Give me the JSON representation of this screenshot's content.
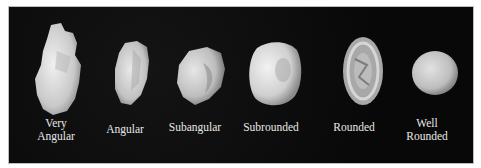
{
  "figure": {
    "background_color": "#0b0b0b",
    "label_color": "#e8e8e8",
    "classes": [
      {
        "label": "Very\nAngular",
        "x": 55,
        "shape": "very-angular"
      },
      {
        "label": "Angular",
        "x": 124,
        "shape": "angular"
      },
      {
        "label": "Subangular",
        "x": 194,
        "shape": "subangular"
      },
      {
        "label": "Subrounded",
        "x": 270,
        "shape": "subrounded"
      },
      {
        "label": "Rounded",
        "x": 353,
        "shape": "rounded"
      },
      {
        "label": "Well\nRounded",
        "x": 426,
        "shape": "well-rounded"
      }
    ]
  }
}
